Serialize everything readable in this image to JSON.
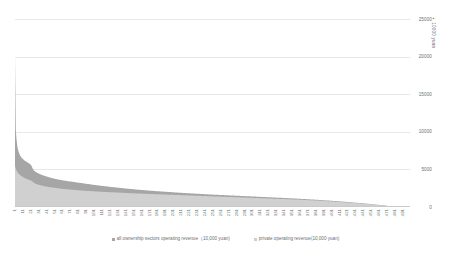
{
  "chart_data": {
    "type": "area",
    "title": "",
    "subtitle": "",
    "xlabel": "",
    "ylabel": "10000 yuan",
    "ylim": [
      0,
      25000
    ],
    "xlim": [
      1,
      500
    ],
    "grid": true,
    "legend_position": "bottom",
    "y_ticks": [
      "25000",
      "20000",
      "15000",
      "10000",
      "5000",
      "0"
    ],
    "y_tick_values": [
      25000,
      20000,
      15000,
      10000,
      5000,
      0
    ],
    "x_ticks": [
      "1",
      "11",
      "21",
      "31",
      "41",
      "51",
      "61",
      "71",
      "81",
      "91",
      "101",
      "111",
      "121",
      "131",
      "141",
      "151",
      "161",
      "171",
      "181",
      "191",
      "201",
      "211",
      "221",
      "231",
      "241",
      "251",
      "261",
      "271",
      "281",
      "291",
      "301",
      "311",
      "321",
      "331",
      "341",
      "351",
      "361",
      "371",
      "381",
      "391",
      "401",
      "411",
      "421",
      "431",
      "441",
      "451",
      "461",
      "471",
      "481",
      "491"
    ],
    "series": [
      {
        "name": "all ownership sectors operating revenue（10,000 yuan)",
        "color": "#a6a6a6",
        "values": [
          20100,
          10250,
          8900,
          8050,
          7550,
          7200,
          6950,
          6750,
          6600,
          6480,
          6380,
          6290,
          6200,
          6120,
          6050,
          5980,
          5910,
          5840,
          5770,
          5700,
          5620,
          5450,
          5200,
          5000,
          4860,
          4760,
          4680,
          4610,
          4550,
          4500,
          4450,
          4400,
          4355,
          4310,
          4270,
          4230,
          4190,
          4150,
          4115,
          4080,
          4045,
          4010,
          3980,
          3950,
          3920,
          3890,
          3860,
          3835,
          3810,
          3785,
          3760,
          3735,
          3710,
          3690,
          3670,
          3650,
          3630,
          3610,
          3590,
          3570,
          3550,
          3530,
          3510,
          3495,
          3480,
          3465,
          3450,
          3435,
          3420,
          3405,
          3390,
          3375,
          3360,
          3345,
          3330,
          3315,
          3300,
          3285,
          3270,
          3255,
          3240,
          3225,
          3210,
          3195,
          3180,
          3165,
          3150,
          3135,
          3120,
          3105,
          3090,
          3075,
          3060,
          3045,
          3030,
          3015,
          3000,
          2985,
          2970,
          2955,
          2940,
          2925,
          2910,
          2895,
          2880,
          2868,
          2856,
          2844,
          2832,
          2820,
          2808,
          2796,
          2784,
          2772,
          2760,
          2748,
          2736,
          2724,
          2712,
          2700,
          2688,
          2676,
          2664,
          2652,
          2640,
          2628,
          2616,
          2604,
          2592,
          2580,
          2568,
          2556,
          2544,
          2532,
          2520,
          2510,
          2500,
          2490,
          2480,
          2470,
          2460,
          2450,
          2440,
          2430,
          2420,
          2410,
          2400,
          2390,
          2380,
          2370,
          2360,
          2350,
          2340,
          2330,
          2320,
          2310,
          2300,
          2290,
          2280,
          2270,
          2262,
          2254,
          2246,
          2238,
          2230,
          2222,
          2214,
          2206,
          2198,
          2190,
          2182,
          2174,
          2166,
          2158,
          2150,
          2142,
          2134,
          2126,
          2118,
          2110,
          2102,
          2094,
          2086,
          2078,
          2070,
          2063,
          2056,
          2049,
          2042,
          2035,
          2028,
          2021,
          2014,
          2007,
          2000,
          1993,
          1986,
          1979,
          1972,
          1965,
          1958,
          1951,
          1944,
          1937,
          1930,
          1923,
          1916,
          1909,
          1902,
          1895,
          1888,
          1881,
          1874,
          1867,
          1860,
          1854,
          1848,
          1842,
          1836,
          1830,
          1824,
          1818,
          1812,
          1806,
          1800,
          1794,
          1788,
          1782,
          1776,
          1770,
          1764,
          1758,
          1752,
          1746,
          1740,
          1734,
          1728,
          1722,
          1716,
          1710,
          1704,
          1698,
          1692,
          1686,
          1680,
          1675,
          1670,
          1665,
          1660,
          1655,
          1650,
          1645,
          1640,
          1635,
          1630,
          1625,
          1620,
          1615,
          1610,
          1605,
          1600,
          1595,
          1590,
          1585,
          1580,
          1575,
          1570,
          1565,
          1560,
          1555,
          1550,
          1545,
          1540,
          1535,
          1530,
          1525,
          1520,
          1515,
          1510,
          1505,
          1500,
          1495,
          1490,
          1485,
          1480,
          1475,
          1470,
          1465,
          1460,
          1455,
          1450,
          1445,
          1440,
          1435,
          1430,
          1425,
          1420,
          1415,
          1410,
          1405,
          1400,
          1395,
          1390,
          1385,
          1380,
          1375,
          1370,
          1365,
          1360,
          1355,
          1350,
          1345,
          1340,
          1335,
          1330,
          1325,
          1320,
          1315,
          1310,
          1305,
          1300,
          1295,
          1290,
          1285,
          1280,
          1275,
          1270,
          1265,
          1260,
          1255,
          1250,
          1245,
          1240,
          1235,
          1230,
          1225,
          1220,
          1215,
          1210,
          1205,
          1200,
          1195,
          1190,
          1185,
          1180,
          1175,
          1170,
          1165,
          1160,
          1155,
          1150,
          1144,
          1138,
          1132,
          1126,
          1120,
          1114,
          1108,
          1102,
          1096,
          1090,
          1084,
          1078,
          1072,
          1066,
          1060,
          1054,
          1048,
          1042,
          1036,
          1030,
          1024,
          1018,
          1012,
          1006,
          1000,
          994,
          988,
          982,
          976,
          970,
          963,
          956,
          949,
          942,
          935,
          928,
          921,
          914,
          907,
          900,
          893,
          886,
          879,
          872,
          865,
          858,
          851,
          844,
          837,
          830,
          822,
          814,
          806,
          798,
          790,
          782,
          774,
          766,
          758,
          750,
          742,
          734,
          726,
          718,
          710,
          702,
          694,
          686,
          678,
          670,
          661,
          652,
          643,
          634,
          625,
          616,
          607,
          598,
          589,
          580,
          571,
          562,
          553,
          544,
          535,
          526,
          517,
          508,
          499,
          490,
          480,
          470,
          460,
          450,
          440,
          430,
          420,
          410,
          400,
          390,
          379,
          368,
          357,
          346,
          335,
          324,
          313,
          302,
          291,
          280,
          268,
          256,
          244,
          232,
          220,
          208,
          196,
          184,
          172,
          160,
          148,
          136,
          124,
          112,
          100,
          90,
          80,
          70,
          60,
          52,
          45,
          39,
          34,
          30,
          26,
          22,
          19,
          16,
          13,
          11,
          9,
          7,
          6,
          5,
          4,
          3,
          2,
          1,
          1
        ]
      },
      {
        "name": "private operating revenue(10,000 yuan)",
        "color": "#d0d0d0",
        "values": [
          5500,
          5100,
          4850,
          4650,
          4500,
          4380,
          4280,
          4190,
          4110,
          4040,
          3980,
          3920,
          3865,
          3815,
          3765,
          3720,
          3675,
          3632,
          3590,
          3550,
          3512,
          3470,
          3380,
          3290,
          3210,
          3150,
          3100,
          3058,
          3020,
          2985,
          2952,
          2922,
          2894,
          2868,
          2843,
          2819,
          2796,
          2774,
          2753,
          2733,
          2713,
          2694,
          2676,
          2658,
          2641,
          2624,
          2608,
          2592,
          2577,
          2562,
          2547,
          2533,
          2519,
          2506,
          2493,
          2480,
          2467,
          2455,
          2443,
          2431,
          2419,
          2408,
          2397,
          2386,
          2375,
          2365,
          2355,
          2345,
          2335,
          2325,
          2315,
          2305,
          2296,
          2287,
          2278,
          2269,
          2260,
          2251,
          2242,
          2234,
          2226,
          2218,
          2210,
          2202,
          2194,
          2186,
          2178,
          2170,
          2163,
          2156,
          2149,
          2142,
          2135,
          2128,
          2121,
          2114,
          2107,
          2100,
          2094,
          2088,
          2082,
          2076,
          2070,
          2064,
          2058,
          2052,
          2046,
          2040,
          2034,
          2028,
          2022,
          2016,
          2010,
          2005,
          2000,
          1995,
          1990,
          1985,
          1980,
          1975,
          1970,
          1965,
          1960,
          1955,
          1950,
          1945,
          1940,
          1935,
          1930,
          1925,
          1920,
          1915,
          1910,
          1905,
          1900,
          1895,
          1890,
          1885,
          1880,
          1875,
          1870,
          1865,
          1860,
          1855,
          1850,
          1845,
          1840,
          1835,
          1830,
          1825,
          1820,
          1815,
          1810,
          1805,
          1800,
          1796,
          1792,
          1788,
          1784,
          1780,
          1776,
          1772,
          1768,
          1764,
          1760,
          1756,
          1752,
          1748,
          1744,
          1740,
          1736,
          1732,
          1728,
          1724,
          1720,
          1716,
          1712,
          1708,
          1704,
          1700,
          1696,
          1692,
          1688,
          1684,
          1680,
          1676,
          1672,
          1668,
          1664,
          1660,
          1656,
          1652,
          1648,
          1644,
          1640,
          1636,
          1632,
          1628,
          1624,
          1620,
          1616,
          1612,
          1608,
          1604,
          1600,
          1596,
          1592,
          1588,
          1584,
          1580,
          1576,
          1572,
          1568,
          1564,
          1560,
          1556,
          1552,
          1548,
          1544,
          1540,
          1536,
          1532,
          1528,
          1524,
          1520,
          1516,
          1512,
          1508,
          1504,
          1500,
          1496,
          1492,
          1488,
          1484,
          1480,
          1476,
          1472,
          1468,
          1464,
          1460,
          1456,
          1452,
          1448,
          1444,
          1440,
          1436,
          1432,
          1428,
          1424,
          1420,
          1416,
          1412,
          1408,
          1404,
          1400,
          1396,
          1392,
          1388,
          1384,
          1380,
          1376,
          1372,
          1368,
          1364,
          1360,
          1356,
          1352,
          1348,
          1344,
          1340,
          1336,
          1332,
          1328,
          1324,
          1320,
          1316,
          1312,
          1308,
          1304,
          1300,
          1296,
          1292,
          1288,
          1284,
          1280,
          1276,
          1272,
          1268,
          1264,
          1260,
          1256,
          1252,
          1248,
          1244,
          1240,
          1236,
          1232,
          1228,
          1224,
          1220,
          1216,
          1212,
          1208,
          1204,
          1200,
          1196,
          1192,
          1188,
          1184,
          1180,
          1176,
          1172,
          1168,
          1164,
          1160,
          1156,
          1152,
          1148,
          1144,
          1140,
          1136,
          1132,
          1128,
          1124,
          1120,
          1116,
          1112,
          1108,
          1104,
          1100,
          1096,
          1092,
          1088,
          1084,
          1080,
          1076,
          1072,
          1068,
          1064,
          1060,
          1056,
          1052,
          1048,
          1044,
          1040,
          1036,
          1032,
          1028,
          1024,
          1020,
          1016,
          1011,
          1006,
          1001,
          996,
          991,
          986,
          981,
          976,
          971,
          966,
          961,
          956,
          951,
          946,
          941,
          936,
          931,
          926,
          921,
          916,
          911,
          906,
          901,
          896,
          891,
          886,
          881,
          876,
          871,
          866,
          860,
          854,
          848,
          842,
          836,
          830,
          824,
          818,
          812,
          806,
          800,
          794,
          788,
          782,
          776,
          770,
          764,
          758,
          752,
          746,
          739,
          732,
          725,
          718,
          711,
          704,
          697,
          690,
          683,
          676,
          669,
          662,
          655,
          648,
          641,
          634,
          627,
          620,
          613,
          606,
          598,
          590,
          582,
          574,
          566,
          558,
          550,
          542,
          534,
          526,
          518,
          510,
          502,
          494,
          486,
          478,
          470,
          462,
          454,
          446,
          437,
          428,
          419,
          410,
          401,
          392,
          383,
          374,
          365,
          356,
          346,
          336,
          326,
          316,
          306,
          296,
          286,
          276,
          266,
          256,
          245,
          234,
          223,
          212,
          201,
          190,
          179,
          168,
          157,
          146,
          135,
          124,
          113,
          102,
          91,
          82,
          73,
          64,
          55,
          47,
          41,
          35,
          31,
          27,
          23,
          20,
          17,
          14,
          12,
          10,
          8,
          6,
          5,
          4,
          3,
          3,
          2,
          1,
          1
        ]
      }
    ]
  },
  "legend": [
    {
      "label": "all ownership sectors operating revenue（10,000 yuan)",
      "color": "#a6a6a6",
      "marker": "legend-swatch-icon"
    },
    {
      "label": "private operating revenue(10,000 yuan)",
      "color": "#d0d0d0",
      "marker": "legend-swatch-icon"
    }
  ],
  "axis_title_marker": "▪"
}
